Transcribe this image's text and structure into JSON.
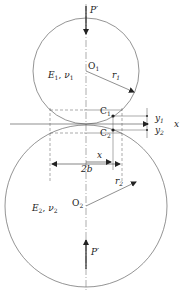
{
  "diagram": {
    "labels": {
      "force_top": "P′",
      "force_bottom": "P′",
      "center_top": "O",
      "center_top_sub": "1",
      "center_bottom": "O",
      "center_bottom_sub": "2",
      "radius_top": "r",
      "radius_top_sub": "1",
      "radius_bottom": "r",
      "radius_bottom_sub": "2",
      "material_top_E": "E",
      "material_top_E_sub": "1",
      "material_top_nu": "ν",
      "material_top_nu_sub": "1",
      "material_bottom_E": "E",
      "material_bottom_E_sub": "2",
      "material_bottom_nu": "ν",
      "material_bottom_nu_sub": "2",
      "point_c1": "C",
      "point_c1_sub": "1",
      "point_c2": "C",
      "point_c2_sub": "2",
      "y1": "y",
      "y1_sub": "1",
      "y2": "y",
      "y2_sub": "2",
      "x_axis": "x",
      "x_dim": "x",
      "width_dim": "2b"
    },
    "colors": {
      "stroke": "#555555",
      "arrow": "#222222",
      "text": "#222222"
    }
  }
}
